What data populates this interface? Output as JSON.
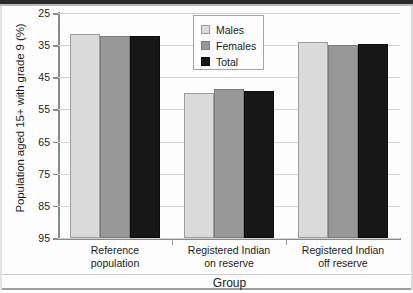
{
  "chart_data": {
    "type": "bar",
    "title": "",
    "xlabel": "Group",
    "ylabel": "Population aged 15+ with grade 9 (%)",
    "ylim": [
      25,
      95
    ],
    "yticks": [
      25,
      35,
      45,
      55,
      65,
      75,
      85,
      95
    ],
    "grid": true,
    "legend_position": "top-center",
    "categories": [
      "Reference population",
      "Registered Indian on reserve",
      "Registered Indian off reserve"
    ],
    "category_lines": [
      [
        "Reference",
        "population"
      ],
      [
        "Registered Indian",
        "on reserve"
      ],
      [
        "Registered Indian",
        "off reserve"
      ]
    ],
    "series": [
      {
        "name": "Males",
        "color": "#dadada",
        "values": [
          88.5,
          70.0,
          86.0
        ]
      },
      {
        "name": "Females",
        "color": "#989898",
        "values": [
          88.0,
          71.5,
          85.0
        ]
      },
      {
        "name": "Total",
        "color": "#171717",
        "values": [
          88.0,
          70.7,
          85.3
        ]
      }
    ]
  },
  "axis": {
    "y_title": "Population aged 15+ with grade 9 (%)",
    "x_title": "Group",
    "tick_labels": [
      "95",
      "85",
      "75",
      "65",
      "55",
      "45",
      "35",
      "25"
    ]
  },
  "legend": {
    "entries": [
      {
        "label": "Males",
        "swatch": "swatch-males"
      },
      {
        "label": "Females",
        "swatch": "swatch-females"
      },
      {
        "label": "Total",
        "swatch": "swatch-total"
      }
    ]
  }
}
